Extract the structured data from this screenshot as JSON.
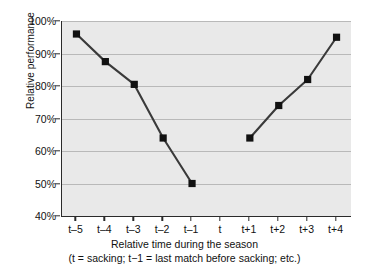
{
  "chart_data": {
    "type": "line",
    "title": "",
    "xlabel": "Relative time during the season",
    "xlabel_note": "(t = sacking; t−1 = last match before sacking; etc.)",
    "ylabel": "Relative performance",
    "categories": [
      "t–5",
      "t–4",
      "t–3",
      "t–2",
      "t–1",
      "t",
      "t+1",
      "t+2",
      "t+3",
      "t+4"
    ],
    "values": [
      96,
      87.5,
      80.5,
      64,
      50,
      null,
      64,
      74,
      82,
      95
    ],
    "y_tick_labels": [
      "40%",
      "50%",
      "60%",
      "70%",
      "80%",
      "90%",
      "100%"
    ],
    "y_tick_values": [
      40,
      50,
      60,
      70,
      80,
      90,
      100
    ],
    "ylim": [
      40,
      100
    ],
    "grid": true,
    "legend": "none",
    "series": [
      {
        "name": "Relative performance",
        "values": [
          96,
          87.5,
          80.5,
          64,
          50,
          null,
          64,
          74,
          82,
          95
        ],
        "marker": "filled-square",
        "marker_color": "#111111",
        "line_color": "#3a3a3a",
        "break_at": "t"
      }
    ],
    "colors": {
      "plot_background": "#e9e9e9",
      "page_background": "#ffffff",
      "gridline": "#b9b9b9",
      "axis": "#2b2b2b",
      "text": "#111111"
    }
  }
}
